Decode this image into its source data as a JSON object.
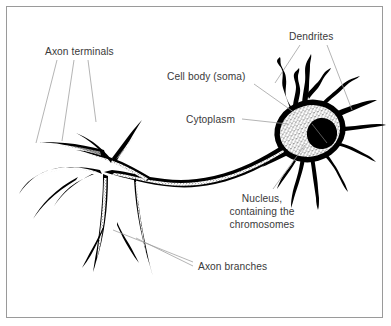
{
  "figure": {
    "background_color": "#ffffff",
    "border_color": "#9a9a9a",
    "ink_color": "#000000",
    "label_color": "#3a3a3a",
    "leader_color": "#9b9b9b",
    "style": "pen-and-ink line drawing with stippled shading"
  },
  "labels": {
    "axon_terminals": "Axon terminals",
    "dendrites": "Dendrites",
    "cell_body": "Cell body (soma)",
    "cytoplasm": "Cytoplasm",
    "nucleus_line1": "Nucleus,",
    "nucleus_line2": "containing the",
    "nucleus_line3": "chromosomes",
    "axon_branches": "Axon branches"
  },
  "parts": [
    {
      "name": "axon-terminals",
      "label": "Axon terminals",
      "leader_count": 3,
      "position": "upper-left"
    },
    {
      "name": "dendrites",
      "label": "Dendrites",
      "leader_count": 2,
      "position": "upper-right"
    },
    {
      "name": "cell-body",
      "label": "Cell body (soma)",
      "leader_count": 1,
      "position": "upper-middle"
    },
    {
      "name": "cytoplasm",
      "label": "Cytoplasm",
      "leader_count": 1,
      "position": "middle"
    },
    {
      "name": "nucleus",
      "label": "Nucleus, containing the chromosomes",
      "leader_count": 1,
      "position": "lower-right"
    },
    {
      "name": "axon-branches",
      "label": "Axon branches",
      "leader_count": 2,
      "position": "lower-middle"
    }
  ]
}
